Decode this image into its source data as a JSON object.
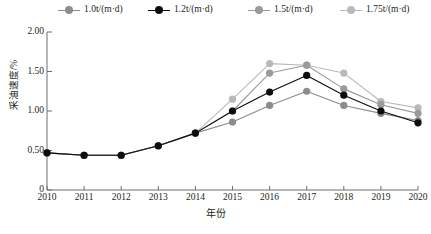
{
  "legend": {
    "position": "top",
    "entries": [
      {
        "label": "1.0t/(m·d)",
        "color": "#8c8c8c",
        "x": 58
      },
      {
        "label": "1.2t/(m·d)",
        "color": "#0d0d0d",
        "x": 148
      },
      {
        "label": "1.5t/(m·d)",
        "color": "#9a9a9a",
        "x": 248
      },
      {
        "label": "1.75t/(m·d)",
        "color": "#b9b9b9",
        "x": 340
      }
    ]
  },
  "axes": {
    "ylabel": "采油速度/%",
    "xlabel": "年份",
    "yticks": [
      "2.00",
      "1.50",
      "1.00",
      "0.50",
      "0"
    ],
    "ytick_values": [
      2.0,
      1.5,
      1.0,
      0.5,
      0
    ],
    "xticks": [
      "2010",
      "2011",
      "2012",
      "2013",
      "2014",
      "2015",
      "2016",
      "2017",
      "2018",
      "2019",
      "2020"
    ]
  },
  "chart_data": {
    "type": "line",
    "title": "",
    "xlabel": "年份",
    "ylabel": "采油速度/%",
    "x": [
      2010,
      2011,
      2012,
      2013,
      2014,
      2015,
      2016,
      2017,
      2018,
      2019,
      2020
    ],
    "categories": [
      "2010",
      "2011",
      "2012",
      "2013",
      "2014",
      "2015",
      "2016",
      "2017",
      "2018",
      "2019",
      "2020"
    ],
    "xlim": [
      2010,
      2020
    ],
    "ylim": [
      0,
      2.0
    ],
    "grid": false,
    "legend_position": "top",
    "series": [
      {
        "name": "1.0t/(m·d)",
        "color": "#8c8c8c",
        "values": [
          0.47,
          0.44,
          0.44,
          0.56,
          0.72,
          0.86,
          1.07,
          1.25,
          1.07,
          0.97,
          0.88
        ]
      },
      {
        "name": "1.2t/(m·d)",
        "color": "#0d0d0d",
        "values": [
          0.47,
          0.44,
          0.44,
          0.56,
          0.72,
          1.0,
          1.24,
          1.45,
          1.2,
          1.0,
          0.85
        ]
      },
      {
        "name": "1.5t/(m·d)",
        "color": "#9a9a9a",
        "values": [
          0.47,
          0.44,
          0.44,
          0.56,
          0.72,
          1.0,
          1.48,
          1.58,
          1.28,
          1.08,
          0.97
        ]
      },
      {
        "name": "1.75t/(m·d)",
        "color": "#b9b9b9",
        "values": [
          0.47,
          0.44,
          0.44,
          0.56,
          0.72,
          1.15,
          1.6,
          1.58,
          1.48,
          1.12,
          1.04
        ]
      }
    ]
  }
}
